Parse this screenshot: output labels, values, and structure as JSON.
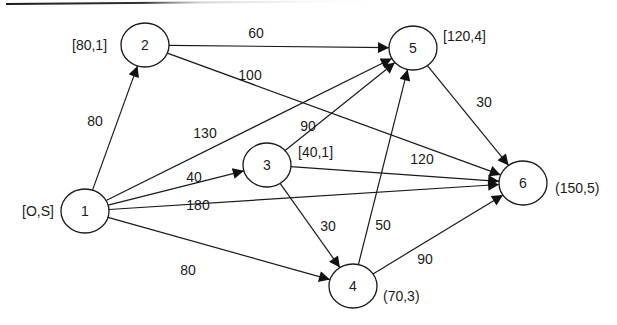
{
  "diagram": {
    "type": "directed-network",
    "top_rule": true,
    "nodes": [
      {
        "id": "1",
        "label": "1",
        "cx": 85,
        "cy": 211,
        "annotation": "[O,S]",
        "ax": 22,
        "ay": 216,
        "anchor": "start"
      },
      {
        "id": "2",
        "label": "2",
        "cx": 145,
        "cy": 45,
        "annotation": "[80,1]",
        "ax": 72,
        "ay": 50,
        "anchor": "start"
      },
      {
        "id": "3",
        "label": "3",
        "cx": 267,
        "cy": 165,
        "annotation": "[40,1]",
        "ax": 298,
        "ay": 157,
        "anchor": "start"
      },
      {
        "id": "4",
        "label": "4",
        "cx": 353,
        "cy": 286,
        "annotation": "(70,3)",
        "ax": 383,
        "ay": 301,
        "anchor": "start"
      },
      {
        "id": "5",
        "label": "5",
        "cx": 413,
        "cy": 48,
        "annotation": "[120,4]",
        "ax": 443,
        "ay": 41,
        "anchor": "start"
      },
      {
        "id": "6",
        "label": "6",
        "cx": 523,
        "cy": 183,
        "annotation": "(150,5)",
        "ax": 555,
        "ay": 193,
        "anchor": "start"
      }
    ],
    "edges": [
      {
        "from": "1",
        "to": "2",
        "weight": "80",
        "lx": 95,
        "ly": 126
      },
      {
        "from": "2",
        "to": "5",
        "weight": "60",
        "lx": 256,
        "ly": 38
      },
      {
        "from": "2",
        "to": "6",
        "weight": "100",
        "lx": 250,
        "ly": 80
      },
      {
        "from": "1",
        "to": "5",
        "weight": "130",
        "lx": 205,
        "ly": 138
      },
      {
        "from": "3",
        "to": "5",
        "weight": "90",
        "lx": 308,
        "ly": 131
      },
      {
        "from": "1",
        "to": "3",
        "weight": "40",
        "lx": 194,
        "ly": 182
      },
      {
        "from": "3",
        "to": "6",
        "weight": "120",
        "lx": 422,
        "ly": 164
      },
      {
        "from": "1",
        "to": "6",
        "weight": "180",
        "lx": 198,
        "ly": 210
      },
      {
        "from": "3",
        "to": "4",
        "weight": "30",
        "lx": 328,
        "ly": 231
      },
      {
        "from": "4",
        "to": "5",
        "weight": "50",
        "lx": 383,
        "ly": 230
      },
      {
        "from": "1",
        "to": "4",
        "weight": "80",
        "lx": 188,
        "ly": 275
      },
      {
        "from": "4",
        "to": "6",
        "weight": "90",
        "lx": 425,
        "ly": 264
      },
      {
        "from": "5",
        "to": "6",
        "weight": "30",
        "lx": 484,
        "ly": 107
      }
    ]
  }
}
